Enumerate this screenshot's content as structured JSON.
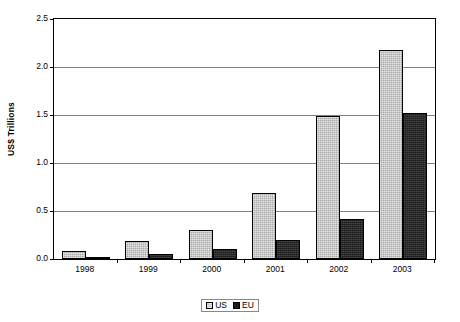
{
  "chart_data": {
    "type": "bar",
    "title": "",
    "subtitle": "",
    "xlabel": "",
    "ylabel": "US$ Trillions",
    "categories": [
      "1998",
      "1999",
      "2000",
      "2001",
      "2002",
      "2003"
    ],
    "series": [
      {
        "name": "US",
        "values": [
          0.08,
          0.19,
          0.3,
          0.69,
          1.49,
          2.18
        ],
        "color": "#a8a8a8"
      },
      {
        "name": "EU",
        "values": [
          0.01,
          0.05,
          0.1,
          0.2,
          0.42,
          1.52
        ],
        "color": "#1c1c1c"
      }
    ],
    "ylim": [
      0.0,
      2.5
    ],
    "ytick_values": [
      0.0,
      0.5,
      1.0,
      1.5,
      2.0,
      2.5
    ],
    "ytick_labels": [
      "0.0",
      "0.5",
      "1.0",
      "1.5",
      "2.0",
      "2.5"
    ],
    "grid": "horizontal",
    "legend_position": "bottom",
    "legend": [
      "US",
      "EU"
    ],
    "annotations": []
  },
  "axes": {
    "y_title": "US$ Trillions"
  },
  "legend": {
    "entries": [
      {
        "label": "US"
      },
      {
        "label": "EU"
      }
    ]
  }
}
